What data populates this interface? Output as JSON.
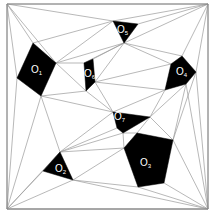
{
  "diagram": {
    "frame": [
      [
        7,
        4
      ],
      [
        208,
        4
      ],
      [
        208,
        209
      ],
      [
        7,
        209
      ]
    ],
    "colors": {
      "edge": "#9a9a9a",
      "obstacle": "#000000",
      "label": "#ffffff",
      "background": "#ffffff"
    },
    "obstacles": [
      {
        "id": "O1",
        "letter": "O",
        "sub": "1",
        "points": [
          [
            33,
            43
          ],
          [
            56,
            63
          ],
          [
            41,
            96
          ],
          [
            17,
            78
          ]
        ],
        "label_pos": [
          31,
          73
        ]
      },
      {
        "id": "O6",
        "letter": "O",
        "sub": "6",
        "points": [
          [
            84,
            63
          ],
          [
            93,
            59
          ],
          [
            95,
            82
          ],
          [
            86,
            91
          ]
        ],
        "label_pos": [
          84,
          77
        ]
      },
      {
        "id": "O5",
        "letter": "O",
        "sub": "5",
        "points": [
          [
            113,
            21
          ],
          [
            138,
            24
          ],
          [
            124,
            43
          ]
        ],
        "label_pos": [
          117,
          33
        ]
      },
      {
        "id": "O4",
        "letter": "O",
        "sub": "4",
        "points": [
          [
            182,
            56
          ],
          [
            196,
            72
          ],
          [
            186,
            84
          ],
          [
            165,
            90
          ],
          [
            171,
            64
          ]
        ],
        "label_pos": [
          176,
          75
        ]
      },
      {
        "id": "O7",
        "letter": "O",
        "sub": "7",
        "points": [
          [
            113,
            112
          ],
          [
            150,
            117
          ],
          [
            123,
            133
          ],
          [
            117,
            128
          ]
        ],
        "label_pos": [
          114,
          120
        ]
      },
      {
        "id": "O3",
        "letter": "O",
        "sub": "3",
        "points": [
          [
            137,
            133
          ],
          [
            173,
            140
          ],
          [
            164,
            183
          ],
          [
            138,
            187
          ],
          [
            124,
            148
          ]
        ],
        "label_pos": [
          140,
          166
        ]
      },
      {
        "id": "O2",
        "letter": "O",
        "sub": "2",
        "points": [
          [
            60,
            152
          ],
          [
            73,
            180
          ],
          [
            43,
            171
          ]
        ],
        "label_pos": [
          55,
          172
        ]
      }
    ],
    "edges": [
      [
        [
          7,
          4
        ],
        [
          208,
          4
        ]
      ],
      [
        [
          208,
          4
        ],
        [
          208,
          209
        ]
      ],
      [
        [
          208,
          209
        ],
        [
          7,
          209
        ]
      ],
      [
        [
          7,
          209
        ],
        [
          7,
          4
        ]
      ],
      [
        [
          7,
          4
        ],
        [
          33,
          43
        ]
      ],
      [
        [
          7,
          4
        ],
        [
          17,
          78
        ]
      ],
      [
        [
          7,
          4
        ],
        [
          113,
          21
        ]
      ],
      [
        [
          7,
          4
        ],
        [
          56,
          63
        ]
      ],
      [
        [
          113,
          21
        ],
        [
          208,
          4
        ]
      ],
      [
        [
          138,
          24
        ],
        [
          208,
          4
        ]
      ],
      [
        [
          208,
          4
        ],
        [
          182,
          56
        ]
      ],
      [
        [
          208,
          4
        ],
        [
          196,
          72
        ]
      ],
      [
        [
          208,
          4
        ],
        [
          124,
          43
        ]
      ],
      [
        [
          33,
          43
        ],
        [
          113,
          21
        ]
      ],
      [
        [
          56,
          63
        ],
        [
          113,
          21
        ]
      ],
      [
        [
          56,
          63
        ],
        [
          124,
          43
        ]
      ],
      [
        [
          56,
          63
        ],
        [
          84,
          63
        ]
      ],
      [
        [
          56,
          63
        ],
        [
          86,
          91
        ]
      ],
      [
        [
          84,
          63
        ],
        [
          124,
          43
        ]
      ],
      [
        [
          93,
          59
        ],
        [
          124,
          43
        ]
      ],
      [
        [
          124,
          43
        ],
        [
          171,
          64
        ]
      ],
      [
        [
          124,
          43
        ],
        [
          95,
          82
        ]
      ],
      [
        [
          124,
          43
        ],
        [
          182,
          56
        ]
      ],
      [
        [
          95,
          82
        ],
        [
          171,
          64
        ]
      ],
      [
        [
          95,
          82
        ],
        [
          113,
          112
        ]
      ],
      [
        [
          95,
          82
        ],
        [
          165,
          90
        ]
      ],
      [
        [
          41,
          96
        ],
        [
          86,
          91
        ]
      ],
      [
        [
          41,
          96
        ],
        [
          113,
          112
        ]
      ],
      [
        [
          41,
          96
        ],
        [
          60,
          152
        ]
      ],
      [
        [
          41,
          96
        ],
        [
          7,
          209
        ]
      ],
      [
        [
          17,
          78
        ],
        [
          7,
          209
        ]
      ],
      [
        [
          86,
          91
        ],
        [
          113,
          112
        ]
      ],
      [
        [
          113,
          112
        ],
        [
          165,
          90
        ]
      ],
      [
        [
          150,
          117
        ],
        [
          165,
          90
        ]
      ],
      [
        [
          150,
          117
        ],
        [
          186,
          84
        ]
      ],
      [
        [
          150,
          117
        ],
        [
          173,
          140
        ]
      ],
      [
        [
          150,
          117
        ],
        [
          137,
          133
        ]
      ],
      [
        [
          123,
          133
        ],
        [
          137,
          133
        ]
      ],
      [
        [
          123,
          133
        ],
        [
          124,
          148
        ]
      ],
      [
        [
          113,
          112
        ],
        [
          60,
          152
        ]
      ],
      [
        [
          117,
          128
        ],
        [
          60,
          152
        ]
      ],
      [
        [
          123,
          133
        ],
        [
          60,
          152
        ]
      ],
      [
        [
          60,
          152
        ],
        [
          124,
          148
        ]
      ],
      [
        [
          73,
          180
        ],
        [
          124,
          148
        ]
      ],
      [
        [
          73,
          180
        ],
        [
          138,
          187
        ]
      ],
      [
        [
          73,
          180
        ],
        [
          208,
          209
        ]
      ],
      [
        [
          73,
          180
        ],
        [
          7,
          209
        ]
      ],
      [
        [
          43,
          171
        ],
        [
          7,
          209
        ]
      ],
      [
        [
          60,
          152
        ],
        [
          7,
          209
        ]
      ],
      [
        [
          138,
          187
        ],
        [
          208,
          209
        ]
      ],
      [
        [
          164,
          183
        ],
        [
          208,
          209
        ]
      ],
      [
        [
          173,
          140
        ],
        [
          208,
          209
        ]
      ],
      [
        [
          186,
          84
        ],
        [
          208,
          209
        ]
      ],
      [
        [
          196,
          72
        ],
        [
          208,
          209
        ]
      ],
      [
        [
          196,
          72
        ],
        [
          173,
          140
        ]
      ],
      [
        [
          186,
          84
        ],
        [
          173,
          140
        ]
      ],
      [
        [
          17,
          78
        ],
        [
          56,
          63
        ]
      ],
      [
        [
          7,
          209
        ],
        [
          208,
          209
        ]
      ]
    ]
  }
}
